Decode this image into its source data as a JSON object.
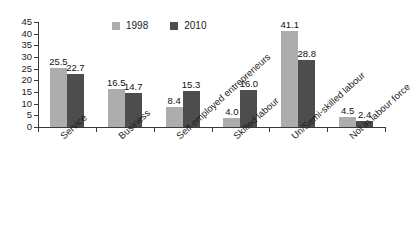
{
  "chart_data": {
    "type": "bar",
    "title": "",
    "subtitle": "",
    "xlabel": "",
    "ylabel": "",
    "ylim": [
      0,
      45
    ],
    "yticks": [
      0,
      5,
      10,
      15,
      20,
      25,
      30,
      35,
      40,
      45
    ],
    "grid": false,
    "legend_position": "top-center",
    "categories": [
      "Service",
      "Business",
      "Self-employed entrepreneurs",
      "Skilled labour",
      "Un/Semi-skilled labour",
      "Not in labour force"
    ],
    "series": [
      {
        "name": "1998",
        "color": "#adadad",
        "values": [
          25.5,
          16.5,
          8.4,
          4.0,
          41.1,
          4.5
        ],
        "labels": [
          "25.5",
          "16.5",
          "8.4",
          "4.0",
          "41.1",
          "4.5"
        ]
      },
      {
        "name": "2010",
        "color": "#4d4d4d",
        "values": [
          22.7,
          14.7,
          15.3,
          16.0,
          28.8,
          2.4
        ],
        "labels": [
          "22.7",
          "14.7",
          "15.3",
          "16.0",
          "28.8",
          "2.4"
        ]
      }
    ]
  },
  "legend": {
    "entries": [
      {
        "label": "1998",
        "color": "#adadad",
        "swatch_name": "legend-swatch-1998"
      },
      {
        "label": "2010",
        "color": "#4d4d4d",
        "swatch_name": "legend-swatch-2010"
      }
    ]
  },
  "axes": {
    "y_tick_labels": [
      "0",
      "5",
      "10",
      "15",
      "20",
      "25",
      "30",
      "35",
      "40",
      "45"
    ],
    "axis_color": "#3a3a3a"
  },
  "colors": {
    "background": "#ffffff",
    "series_1998": "#adadad",
    "series_2010": "#4d4d4d",
    "axis": "#3a3a3a",
    "text": "#1c1c1c"
  }
}
